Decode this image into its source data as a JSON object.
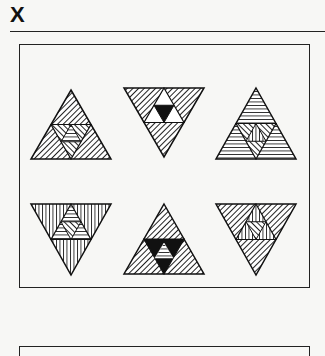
{
  "figure": {
    "label": "X",
    "rows": [
      [
        {
          "orientation": "up",
          "outer_hatch": "diagonal-right",
          "inner_hatch": "diagonal-left",
          "center_hatch": "horizontal"
        },
        {
          "orientation": "down",
          "outer_hatch": "diagonal-right",
          "inner_hatch": "white",
          "center_hatch": "black"
        },
        {
          "orientation": "up",
          "outer_hatch": "horizontal",
          "inner_hatch": "diagonal-left",
          "center_hatch": "vertical"
        }
      ],
      [
        {
          "orientation": "down",
          "outer_hatch": "vertical",
          "inner_hatch": "horizontal",
          "center_hatch": "diagonal-left"
        },
        {
          "orientation": "up",
          "outer_hatch": "diagonal-right",
          "inner_hatch": "black",
          "center_hatch": "horizontal"
        },
        {
          "orientation": "down",
          "outer_hatch": "diagonal-right",
          "inner_hatch": "vertical",
          "center_hatch": "diagonal-left"
        }
      ]
    ]
  }
}
